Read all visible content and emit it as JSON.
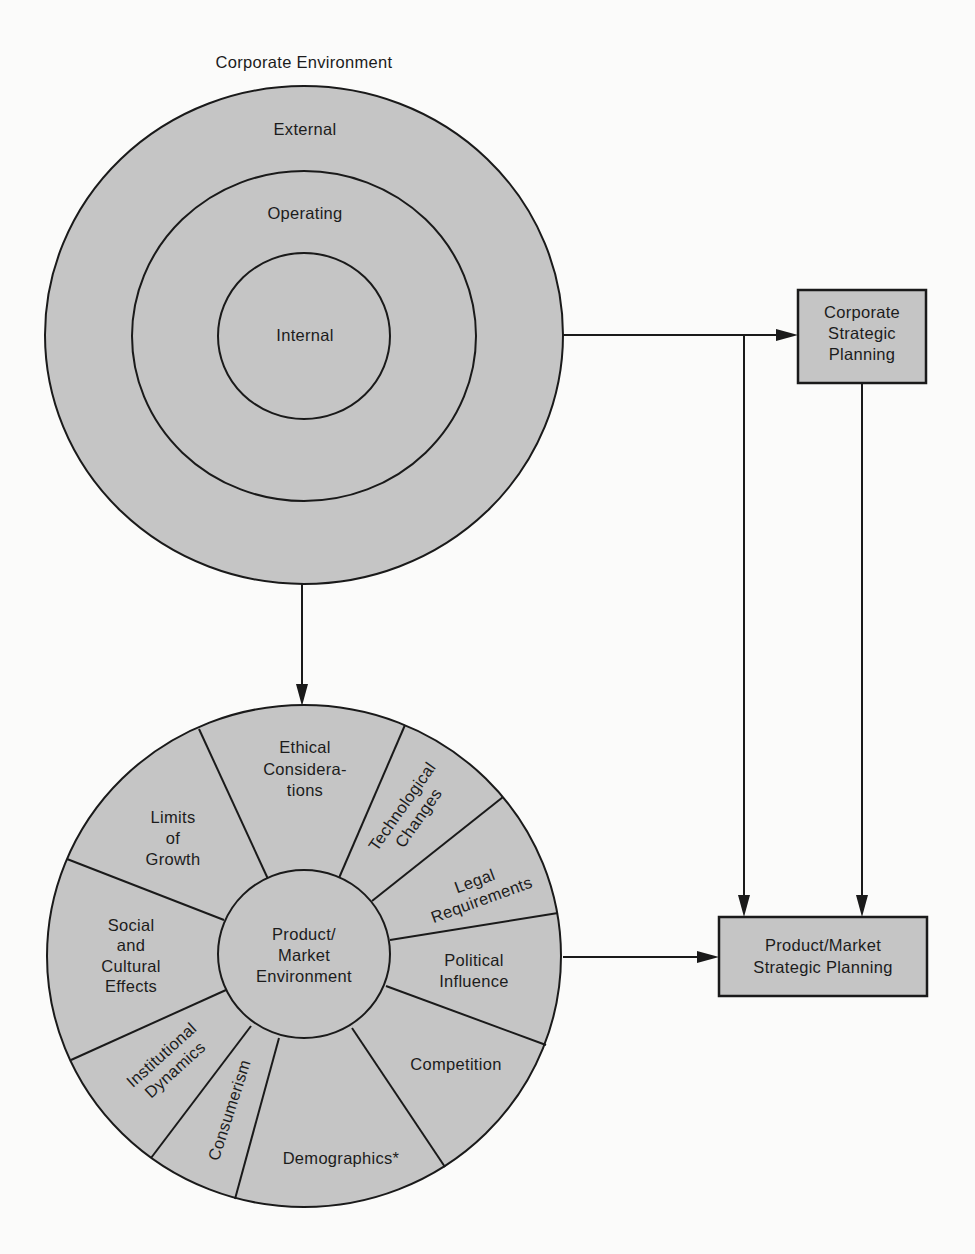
{
  "corporate_environment": {
    "title": "Corporate Environment",
    "rings": {
      "external": "External",
      "operating": "Operating",
      "internal": "Internal"
    }
  },
  "product_market_environment": {
    "center": [
      "Product/",
      "Market",
      "Environment"
    ],
    "segments": {
      "ethical": [
        "Ethical",
        "Considera-",
        "tions"
      ],
      "technological": [
        "Technological",
        "Changes"
      ],
      "legal": [
        "Legal",
        "Requirements"
      ],
      "political": [
        "Political",
        "Influence"
      ],
      "competition": [
        "Competition"
      ],
      "demographics": [
        "Demographics*"
      ],
      "consumerism": [
        "Consumerism"
      ],
      "institutional": [
        "Institutional",
        "Dynamics"
      ],
      "social": [
        "Social",
        "and",
        "Cultural",
        "Effects"
      ],
      "limits": [
        "Limits",
        "of",
        "Growth"
      ]
    }
  },
  "boxes": {
    "corporate_planning": [
      "Corporate",
      "Strategic",
      "Planning"
    ],
    "product_planning": [
      "Product/Market",
      "Strategic Planning"
    ]
  },
  "colors": {
    "fill": "#c5c5c5",
    "stroke": "#1a1a1a",
    "background": "#fbfbfa"
  }
}
